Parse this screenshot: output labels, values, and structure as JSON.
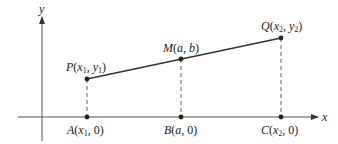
{
  "diagram": {
    "axes": {
      "x_label": "x",
      "y_label": "y"
    },
    "points": {
      "P": {
        "name": "P",
        "coord_a": "x",
        "coord_a_sub": "1",
        "coord_b": "y",
        "coord_b_sub": "1"
      },
      "M": {
        "name": "M",
        "coord_a": "a",
        "coord_b": "b"
      },
      "Q": {
        "name": "Q",
        "coord_a": "x",
        "coord_a_sub": "2",
        "coord_b": "y",
        "coord_b_sub": "2"
      },
      "A": {
        "name": "A",
        "coord_a": "x",
        "coord_a_sub": "1",
        "coord_b": "0"
      },
      "B": {
        "name": "B",
        "coord_a": "a",
        "coord_b": "0"
      },
      "C": {
        "name": "C",
        "coord_a": "x",
        "coord_a_sub": "2",
        "coord_b": "0"
      }
    },
    "colors": {
      "line": "#333333",
      "axis": "#555555",
      "dashed": "#666666",
      "point": "#222222"
    }
  }
}
